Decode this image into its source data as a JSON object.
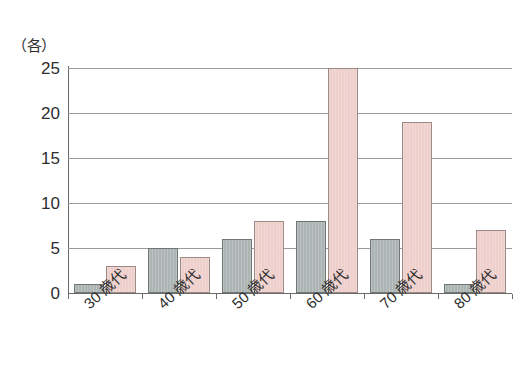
{
  "chart_data": {
    "type": "bar",
    "title": "",
    "xlabel": "",
    "ylabel": "（各）",
    "ylim": [
      0,
      25
    ],
    "yticks": [
      0,
      5,
      10,
      15,
      20,
      25
    ],
    "grid": true,
    "legend": "none",
    "categories": [
      "30 歳代",
      "40 歳代",
      "50 歳代",
      "60 歳代",
      "70 歳代",
      "80 歳代"
    ],
    "series": [
      {
        "name": "gray",
        "color": "#adb4b4",
        "values": [
          1,
          5,
          6,
          8,
          6,
          1
        ]
      },
      {
        "name": "pink",
        "color": "#efcfcb",
        "values": [
          3,
          4,
          8,
          25,
          19,
          7
        ]
      }
    ]
  },
  "axis": {
    "unit_label": "（各）",
    "tick_labels": [
      "25",
      "20",
      "15",
      "10",
      "5",
      "0"
    ]
  },
  "colors": {
    "gray_fill": "#adb4b4",
    "gray_stroke": "#6f7676",
    "pink_fill": "#efcfcb",
    "pink_stroke": "#9c8a87",
    "gridline": "#9a9a9a",
    "axis": "#6a6a6a",
    "background": "#ffffff"
  }
}
